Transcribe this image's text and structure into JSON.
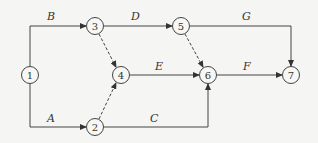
{
  "diagram": {
    "type": "activity-on-arrow network",
    "nodes": [
      {
        "id": "1",
        "label": "1",
        "x": 30,
        "y": 75
      },
      {
        "id": "2",
        "label": "2",
        "x": 95,
        "y": 127
      },
      {
        "id": "3",
        "label": "3",
        "x": 95,
        "y": 26
      },
      {
        "id": "4",
        "label": "4",
        "x": 121,
        "y": 75
      },
      {
        "id": "5",
        "label": "5",
        "x": 181,
        "y": 26
      },
      {
        "id": "6",
        "label": "6",
        "x": 208,
        "y": 75
      },
      {
        "id": "7",
        "label": "7",
        "x": 291,
        "y": 75
      }
    ],
    "edges": [
      {
        "from": "1",
        "to": "3",
        "label": "B",
        "style": "solid"
      },
      {
        "from": "1",
        "to": "2",
        "label": "A",
        "style": "solid"
      },
      {
        "from": "3",
        "to": "5",
        "label": "D",
        "style": "solid"
      },
      {
        "from": "3",
        "to": "4",
        "label": "",
        "style": "dashed"
      },
      {
        "from": "2",
        "to": "4",
        "label": "",
        "style": "dashed"
      },
      {
        "from": "4",
        "to": "6",
        "label": "E",
        "style": "solid"
      },
      {
        "from": "2",
        "to": "6",
        "label": "C",
        "style": "solid"
      },
      {
        "from": "5",
        "to": "6",
        "label": "",
        "style": "dashed"
      },
      {
        "from": "5",
        "to": "7",
        "label": "G",
        "style": "solid"
      },
      {
        "from": "6",
        "to": "7",
        "label": "F",
        "style": "solid"
      }
    ]
  }
}
